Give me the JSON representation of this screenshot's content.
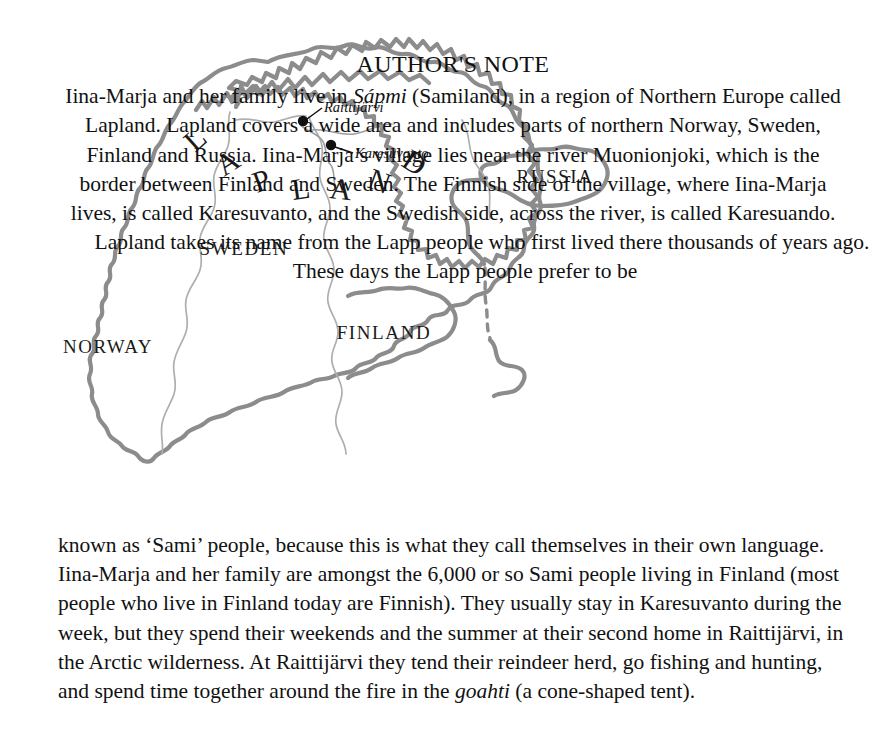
{
  "page": {
    "background": "#ffffff",
    "text_color": "#111111"
  },
  "note": {
    "heading": "AUTHOR'S NOTE",
    "paragraph1_part1": "Iina-Marja and her family live in ",
    "paragraph1_italic1": "Sápmi",
    "paragraph1_part2": " (Samiland), in a region of Northern Europe called Lapland. Lapland covers a wide area and includes parts of northern Norway, Sweden, Finland and Russia. Iina-Marja’s village lies near the river Muonionjoki, which is the border between Finland and Sweden. The Finnish side of the village, where Iina-Marja lives, is called Karesuvanto, and the Swedish side, across the river, is called Karesuando.",
    "paragraph2": "Lapland takes its name from the Lapp people who first lived there thousands of years ago. These days the Lapp people prefer to be",
    "paragraph3_part1": "known as ‘Sami’ people, because this is what they call themselves in their own language. Iina-Marja and her family are amongst the 6,000 or so Sami people living in Finland (most people who live in Finland today are Finnish). They usually stay in Karesuvanto during the week, but they spend their weekends and the summer at their second home in Raittijärvi, in the Arctic wilderness. At Raittijärvi they tend their reindeer herd, go fishing and hunting, and spend time together around the fire in the ",
    "paragraph3_italic": "goahti",
    "paragraph3_part2": " (a cone-shaped tent)."
  },
  "map": {
    "colors": {
      "coastline": "#8c8c8c",
      "inner_border": "#aeaeae",
      "river": "#9c9c9c",
      "marker": "#111111"
    },
    "countries": [
      {
        "name": "NORWAY",
        "x": 108,
        "y": 353
      },
      {
        "name": "SWEDEN",
        "x": 244,
        "y": 255
      },
      {
        "name": "FINLAND",
        "x": 384,
        "y": 339
      },
      {
        "name": "RUSSIA",
        "x": 555,
        "y": 183
      }
    ],
    "region_label": {
      "text": "LAPLAND",
      "letters": [
        {
          "ch": "L",
          "x": 195,
          "y": 153,
          "rot": -42
        },
        {
          "ch": "A",
          "x": 224,
          "y": 177,
          "rot": -33
        },
        {
          "ch": "P",
          "x": 257,
          "y": 193,
          "rot": -20
        },
        {
          "ch": "L",
          "x": 293,
          "y": 200,
          "rot": -8
        },
        {
          "ch": "A",
          "x": 329,
          "y": 198,
          "rot": 6
        },
        {
          "ch": "N",
          "x": 366,
          "y": 187,
          "rot": 20
        },
        {
          "ch": "D",
          "x": 400,
          "y": 165,
          "rot": 34
        }
      ]
    },
    "cities": [
      {
        "name": "Raittijärvi",
        "dot_x": 303,
        "dot_y": 121,
        "label_x": 318,
        "label_y": 112,
        "leader": "M 307 119 L 322 108"
      },
      {
        "name": "Karesuvanto",
        "dot_x": 331,
        "dot_y": 145,
        "label_x": 349,
        "label_y": 157,
        "leader": "M 335 147 L 353 153"
      }
    ]
  }
}
